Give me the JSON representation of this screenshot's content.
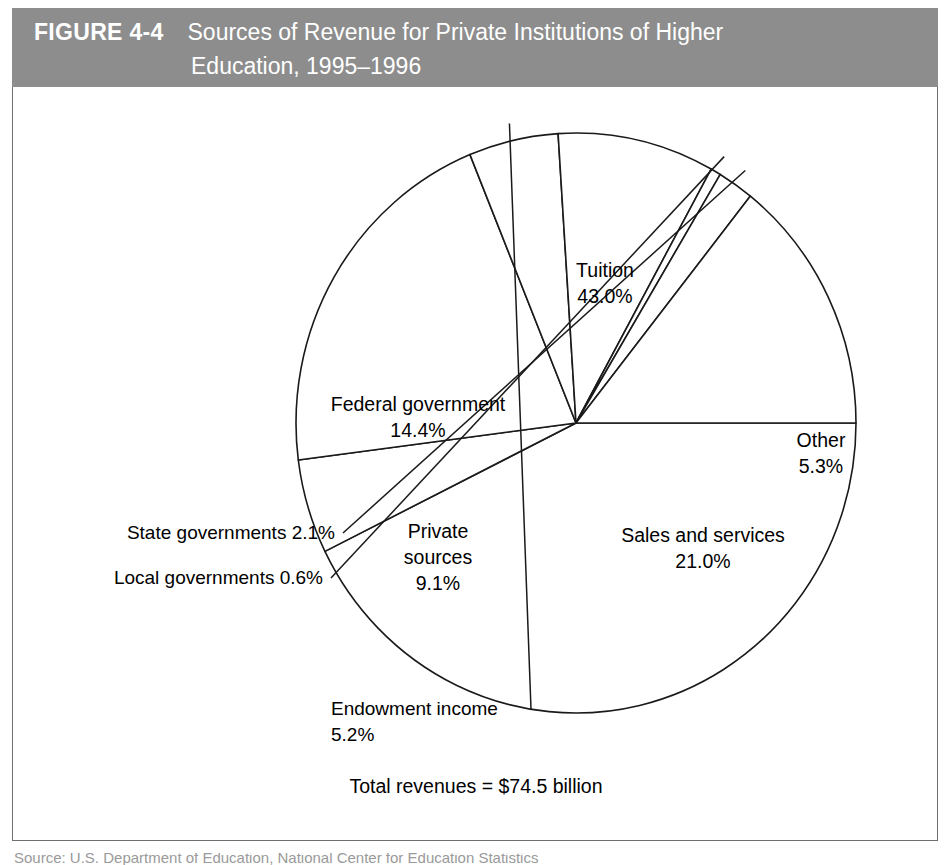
{
  "figure": {
    "number": "FIGURE 4-4",
    "title_line1": "Sources of Revenue for Private Institutions of Higher",
    "title_line2": "Education, 1995–1996",
    "header_bg": "#8d8d8d",
    "header_text_color": "#ffffff"
  },
  "chart_data": {
    "type": "pie",
    "title": "Sources of Revenue for Private Institutions of Higher Education, 1995–1996",
    "unit": "percent",
    "total_label": "Total revenues = $74.5 billion",
    "total_value": 74.5,
    "total_unit": "billion dollars",
    "legend_position": "none",
    "labels_inline": true,
    "categories": [
      "Tuition",
      "Other",
      "Sales and services",
      "Endowment income",
      "Private sources",
      "Local governments",
      "State governments",
      "Federal government"
    ],
    "values": [
      43.0,
      5.3,
      21.0,
      5.2,
      9.1,
      0.6,
      2.1,
      14.4
    ],
    "slices": [
      {
        "name": "Tuition",
        "value": 43.0,
        "label_line1": "Tuition",
        "label_line2": "43.0%",
        "label_x": 592,
        "label_y": 190,
        "label_anchor": "middle",
        "leader": false
      },
      {
        "name": "Other",
        "value": 5.3,
        "label_line1": "Other",
        "label_line2": "5.3%",
        "label_x": 808,
        "label_y": 360,
        "label_anchor": "middle",
        "leader": false
      },
      {
        "name": "Sales and services",
        "value": 21.0,
        "label_line1": "Sales and services",
        "label_line2": "21.0%",
        "label_x": 690,
        "label_y": 455,
        "label_anchor": "middle",
        "leader": false
      },
      {
        "name": "Endowment income",
        "value": 5.2,
        "label_line1": "Endowment income",
        "label_line2": "5.2%",
        "label_x": 318,
        "label_y": 628,
        "label_anchor": "start",
        "leader": true
      },
      {
        "name": "Private sources",
        "value": 9.1,
        "label_line1": "Private",
        "label_line2": "sources",
        "label_line3": "9.1%",
        "label_x": 425,
        "label_y": 451,
        "label_anchor": "middle",
        "leader": false
      },
      {
        "name": "Local governments",
        "value": 0.6,
        "label_line1": "Local governments 0.6%",
        "label_x": 310,
        "label_y": 497,
        "label_anchor": "end",
        "leader": true
      },
      {
        "name": "State governments",
        "value": 2.1,
        "label_line1": "State governments 2.1%",
        "label_x": 322,
        "label_y": 452,
        "label_anchor": "end",
        "leader": true
      },
      {
        "name": "Federal government",
        "value": 14.4,
        "label_line1": "Federal government",
        "label_line2": "14.4%",
        "label_x": 405,
        "label_y": 324,
        "label_anchor": "middle",
        "leader": false
      }
    ],
    "geometry": {
      "center_x": 563,
      "center_y": 336,
      "radius_x": 280,
      "radius_y": 290,
      "start_angle_deg": 0,
      "direction": "clockwise"
    },
    "stroke_color": "#1a1a1a",
    "fill_color": "#ffffff"
  },
  "caption": {
    "cutoff_text": "Source: U.S. Department of Education, National Center for Education Statistics"
  }
}
